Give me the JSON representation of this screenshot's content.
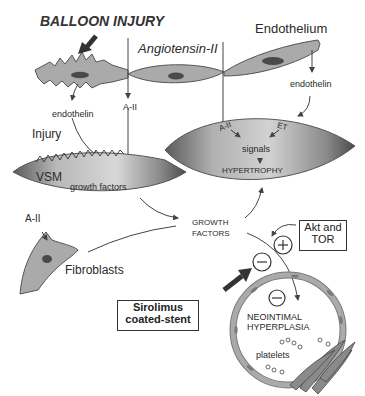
{
  "diagram": {
    "title": "BALLOON INJURY",
    "labels": {
      "angiotensin": "Angiotensin-II",
      "endothelium": "Endothelium",
      "a2_top": "A-II",
      "endothelin_left": "endothelin",
      "endothelin_right": "endothelin",
      "injury": "Injury",
      "vsm": "VSM",
      "growth_factors_small": "growth factors",
      "cell_a2": "A-II",
      "cell_et": "ET",
      "signals": "signals",
      "hypertrophy": "HYPERTROPHY",
      "a2_fibro": "A-II",
      "fibroblasts": "Fibroblasts",
      "growth_factors_line1": "GROWTH",
      "growth_factors_line2": "FACTORS",
      "akt_line1": "Akt and",
      "akt_line2": "TOR",
      "sirolimus_line1": "Sirolimus",
      "sirolimus_line2": "coated-stent",
      "neointimal_line1": "NEOINTIMAL",
      "neointimal_line2": "HYPERPLASIA",
      "platelets": "platelets"
    },
    "symbols": {
      "plus": "+",
      "minus": "−"
    },
    "colors": {
      "cell_fill": "#a9a9a9",
      "cell_dark": "#6e6e6e",
      "nucleus": "#4a4a4a",
      "line": "#444444",
      "arrow_dark": "#333333"
    }
  }
}
